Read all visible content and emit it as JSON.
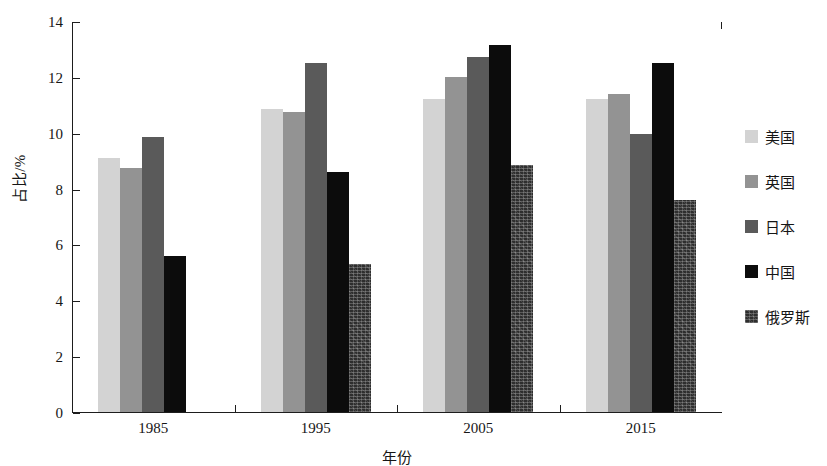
{
  "chart_data": {
    "type": "bar",
    "title": "",
    "subtitle": "",
    "xlabel": "年份",
    "ylabel": "占比/%",
    "categories": [
      "1985",
      "1995",
      "2005",
      "2015"
    ],
    "series": [
      {
        "name": "美国",
        "color": "#d3d3d3",
        "values": [
          9.1,
          10.85,
          11.2,
          11.2
        ]
      },
      {
        "name": "英国",
        "color": "#939393",
        "values": [
          8.75,
          10.75,
          12.0,
          11.4
        ]
      },
      {
        "name": "日本",
        "color": "#5a5a5a",
        "values": [
          9.85,
          12.5,
          12.7,
          9.95
        ]
      },
      {
        "name": "中国",
        "color": "#0c0c0c",
        "values": [
          5.6,
          8.6,
          13.15,
          12.5
        ]
      },
      {
        "name": "俄罗斯",
        "color": "#2e2e2e",
        "values": [
          null,
          5.3,
          8.85,
          7.6
        ]
      }
    ],
    "ylim": [
      0,
      14
    ],
    "yticks": [
      0,
      2,
      4,
      6,
      8,
      10,
      12,
      14
    ],
    "ytick_labels": [
      "0",
      "2",
      "4",
      "6",
      "8",
      "10",
      "12",
      "14"
    ],
    "grid": false,
    "legend_position": "right",
    "axis_color": "#1d1d1d",
    "background": "#ffffff"
  },
  "legend": {
    "items": [
      {
        "label": "美国",
        "swatch": "legend-swatch-usa"
      },
      {
        "label": "英国",
        "swatch": "legend-swatch-uk"
      },
      {
        "label": "日本",
        "swatch": "legend-swatch-japan"
      },
      {
        "label": "中国",
        "swatch": "legend-swatch-china"
      },
      {
        "label": "俄罗斯",
        "swatch": "legend-swatch-russia"
      }
    ]
  }
}
